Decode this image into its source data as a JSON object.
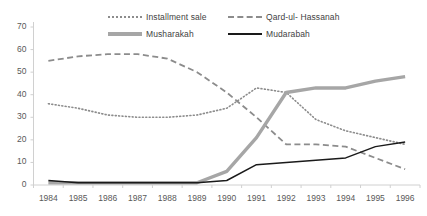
{
  "chart_data": {
    "type": "line",
    "title": "",
    "xlabel": "",
    "ylabel": "",
    "categories": [
      "1984",
      "1985",
      "1986",
      "1987",
      "1988",
      "1989",
      "1990",
      "1991",
      "1992",
      "1993",
      "1994",
      "1995",
      "1996"
    ],
    "ylim": [
      0,
      70
    ],
    "yticks": [
      0,
      10,
      20,
      30,
      40,
      50,
      60,
      70
    ],
    "grid": false,
    "legend_position": "top-center",
    "series": [
      {
        "name": "Installment sale",
        "style": "dotted",
        "color": "#8c8c8c",
        "values": [
          36,
          34,
          31,
          30,
          30,
          31,
          34,
          43,
          41,
          29,
          24,
          21,
          18
        ]
      },
      {
        "name": "Qard-ul- Hassanah",
        "style": "dashed",
        "color": "#8c8c8c",
        "values": [
          55,
          57,
          58,
          58,
          56,
          50,
          41,
          30,
          18,
          18,
          17,
          12,
          7
        ]
      },
      {
        "name": "Musharakah",
        "style": "thick-solid",
        "color": "#a6a6a6",
        "values": [
          1,
          1,
          1,
          1,
          1,
          1,
          6,
          21,
          41,
          43,
          43,
          46,
          48
        ]
      },
      {
        "name": "Mudarabah",
        "style": "solid",
        "color": "#1a1a1a",
        "values": [
          2,
          1,
          1,
          1,
          1,
          1,
          2,
          9,
          10,
          11,
          12,
          17,
          19
        ]
      }
    ]
  },
  "legend": {
    "items": [
      {
        "label": "Installment sale"
      },
      {
        "label": "Qard-ul- Hassanah"
      },
      {
        "label": "Musharakah"
      },
      {
        "label": "Mudarabah"
      }
    ]
  },
  "axes": {
    "y_tick_labels": [
      "70",
      "60",
      "50",
      "40",
      "30",
      "20",
      "10",
      "0"
    ],
    "x_tick_labels": [
      "1984",
      "1985",
      "1986",
      "1987",
      "1988",
      "1989",
      "1990",
      "1991",
      "1992",
      "1993",
      "1994",
      "1995",
      "1996"
    ]
  }
}
